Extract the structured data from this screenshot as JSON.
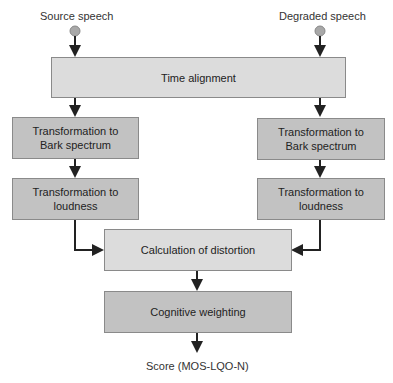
{
  "inputs": {
    "source": "Source speech",
    "degraded": "Degraded speech"
  },
  "blocks": {
    "time_alignment": "Time alignment",
    "left_bark": "Transformation to\nBark spectrum",
    "left_loudness": "Transformation to\nloudness",
    "right_bark": "Transformation to\nBark spectrum",
    "right_loudness": "Transformation to\nloudness",
    "distortion": "Calculation of distortion",
    "cognitive": "Cognitive weighting"
  },
  "output": {
    "score": "Score (MOS-LQO-N)"
  },
  "colors": {
    "light_box": "#dcdcdc",
    "dark_box": "#c2c2c2",
    "node": "#a8a8a8",
    "line": "#222222"
  }
}
